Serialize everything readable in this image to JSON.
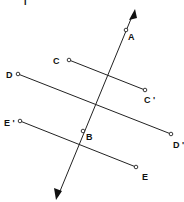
{
  "diagram": {
    "stray_fragment": "I",
    "transversal": {
      "from": [
        56,
        200
      ],
      "to": [
        135,
        10
      ],
      "arrowheads": "both",
      "points": [
        {
          "id": "A",
          "label": "A",
          "x": 126,
          "y": 30
        },
        {
          "id": "B",
          "label": "B",
          "x": 83,
          "y": 131
        }
      ]
    },
    "segments": [
      {
        "id": "CC",
        "start": {
          "label": "C",
          "x": 69,
          "y": 60
        },
        "end": {
          "label": "C '",
          "x": 145,
          "y": 90
        }
      },
      {
        "id": "DD",
        "start": {
          "label": "D",
          "x": 18,
          "y": 74
        },
        "end": {
          "label": "D '",
          "x": 171,
          "y": 134
        }
      },
      {
        "id": "EE",
        "start": {
          "label": "E '",
          "x": 20,
          "y": 121
        },
        "end": {
          "label": "E",
          "x": 136,
          "y": 167
        }
      }
    ],
    "labels": {
      "A": "A",
      "B": "B",
      "C": "C",
      "C_prime": "C '",
      "D": "D",
      "D_prime": "D '",
      "E": "E",
      "E_prime": "E '"
    },
    "colors": {
      "line": "#222222",
      "background": "#ffffff",
      "text": "#111111"
    }
  }
}
